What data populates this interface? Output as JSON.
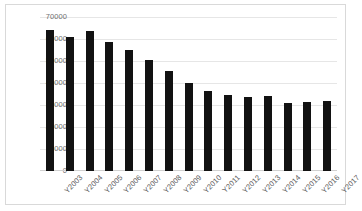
{
  "chart_data": {
    "type": "bar",
    "title": "",
    "subtitle": "",
    "xlabel": "",
    "ylabel": "",
    "categories": [
      "Y2003",
      "Y2004",
      "Y2005",
      "Y2006",
      "Y2007",
      "Y2008",
      "Y2009",
      "Y2010",
      "Y2011",
      "Y2012",
      "Y2013",
      "Y2014",
      "Y2015",
      "Y2016",
      "Y2017"
    ],
    "values": [
      64000,
      61000,
      63500,
      58500,
      55000,
      50500,
      45500,
      40000,
      36500,
      34500,
      33500,
      34000,
      31000,
      31500,
      32000
    ],
    "ylim": [
      0,
      70000
    ],
    "ytick_labels": [
      "70000",
      "60000",
      "50000",
      "40000",
      "30000",
      "20000",
      "10000",
      "0"
    ],
    "ytick_values": [
      70000,
      60000,
      50000,
      40000,
      30000,
      20000,
      10000,
      0
    ],
    "grid": true,
    "legend": false,
    "legend_position": "none",
    "bar_color": "#121212",
    "grid_color": "#e6e6e6",
    "border_color": "#d9d9d9",
    "axis_text_color": "#707070"
  }
}
